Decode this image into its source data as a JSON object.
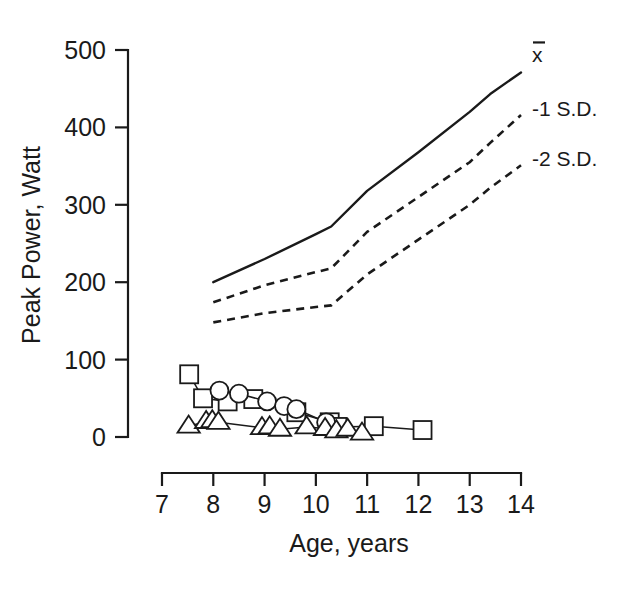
{
  "chart_data": {
    "type": "line",
    "title": "",
    "xlabel": "Age,  years",
    "ylabel": "Peak Power,  Watt",
    "xlim": [
      7,
      14
    ],
    "ylim": [
      0,
      500
    ],
    "xticks": [
      "7",
      "8",
      "9",
      "10",
      "11",
      "12",
      "13",
      "14"
    ],
    "xtick_values": [
      7,
      8,
      9,
      10,
      11,
      12,
      13,
      14
    ],
    "yticks": [
      "0",
      "100",
      "200",
      "300",
      "400",
      "500"
    ],
    "ytick_values": [
      0,
      100,
      200,
      300,
      400,
      500
    ],
    "grid": false,
    "legend_position": "right-inline",
    "reference_curves": [
      {
        "name": "mean",
        "label": "x",
        "label_overbar": "-",
        "style": "solid",
        "x": [
          8.0,
          9.0,
          10.0,
          10.3,
          11.0,
          12.0,
          13.0,
          13.4,
          14.0
        ],
        "y": [
          200,
          230,
          262,
          272,
          318,
          368,
          420,
          443,
          471
        ]
      },
      {
        "name": "minus-1-sd",
        "label": "-1 S.D.",
        "style": "dashed",
        "x": [
          8.0,
          9.0,
          10.0,
          10.3,
          11.0,
          12.0,
          13.0,
          13.4,
          14.0
        ],
        "y": [
          174,
          196,
          213,
          218,
          265,
          310,
          355,
          380,
          416
        ]
      },
      {
        "name": "minus-2-sd",
        "label": "-2 S.D.",
        "style": "dashed",
        "x": [
          8.0,
          9.0,
          10.0,
          10.3,
          11.0,
          12.0,
          13.0,
          13.4,
          14.0
        ],
        "y": [
          148,
          160,
          168,
          170,
          210,
          255,
          300,
          322,
          351
        ]
      }
    ],
    "series": [
      {
        "name": "patients-squares",
        "marker": "square",
        "connected": true,
        "points": [
          {
            "x": 7.53,
            "y": 81
          },
          {
            "x": 7.8,
            "y": 50
          },
          {
            "x": 8.28,
            "y": 46
          },
          {
            "x": 8.78,
            "y": 49
          },
          {
            "x": 9.62,
            "y": 32
          },
          {
            "x": 10.27,
            "y": 19
          },
          {
            "x": 10.42,
            "y": 13
          },
          {
            "x": 11.13,
            "y": 14
          },
          {
            "x": 12.08,
            "y": 9
          }
        ]
      },
      {
        "name": "patients-circles",
        "marker": "circle",
        "connected": true,
        "points": [
          {
            "x": 8.12,
            "y": 60
          },
          {
            "x": 8.5,
            "y": 56
          },
          {
            "x": 9.05,
            "y": 46
          },
          {
            "x": 9.38,
            "y": 40
          },
          {
            "x": 9.62,
            "y": 36
          },
          {
            "x": 10.2,
            "y": 19
          }
        ]
      },
      {
        "name": "patients-triangles",
        "marker": "triangle",
        "connected": true,
        "points": [
          {
            "x": 7.52,
            "y": 14
          },
          {
            "x": 7.86,
            "y": 20
          },
          {
            "x": 7.98,
            "y": 21
          },
          {
            "x": 8.1,
            "y": 19
          },
          {
            "x": 8.95,
            "y": 12
          },
          {
            "x": 9.1,
            "y": 13
          },
          {
            "x": 9.3,
            "y": 10
          },
          {
            "x": 9.82,
            "y": 13
          },
          {
            "x": 10.18,
            "y": 11
          },
          {
            "x": 10.4,
            "y": 8
          },
          {
            "x": 10.62,
            "y": 10
          },
          {
            "x": 10.9,
            "y": 5
          }
        ]
      }
    ]
  }
}
